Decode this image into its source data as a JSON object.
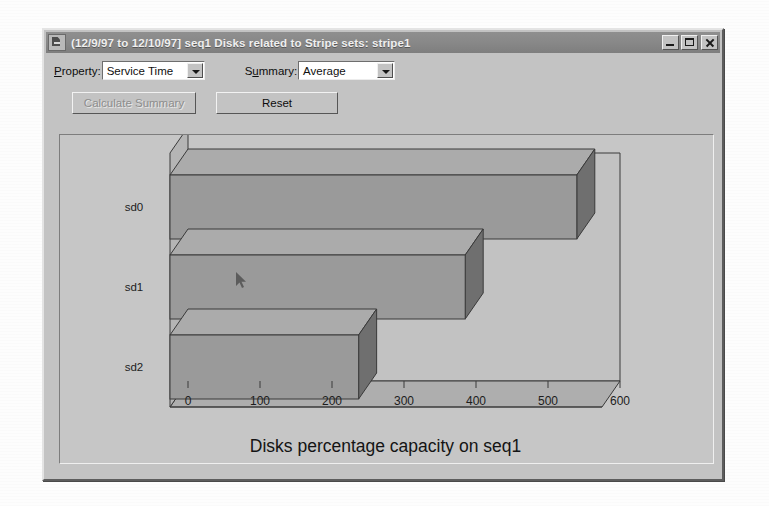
{
  "window": {
    "title": "(12/9/97 to 12/10/97] seq1 Disks related to Stripe sets: stripe1",
    "system_icon": "application-icon",
    "controls": {
      "minimize": "minimize-icon",
      "maximize": "maximize-icon",
      "close": "close-icon"
    }
  },
  "toolbar": {
    "property": {
      "label": "Property:",
      "label_prefix": "P",
      "label_rest": "roperty:",
      "value": "Service Time",
      "options": [
        "Service Time"
      ]
    },
    "summary": {
      "label": "Summary:",
      "label_prefix": "S",
      "label_mid": "u",
      "label_rest": "mmary:",
      "value": "Average",
      "options": [
        "Average"
      ]
    },
    "calculate_summary_label": "Calculate Summary",
    "calculate_summary_enabled": false,
    "reset_label": "Reset",
    "reset_enabled": true
  },
  "chart_data": {
    "type": "bar",
    "orientation": "horizontal",
    "style": "3d",
    "title": "Disks percentage capacity on seq1",
    "xlabel": "",
    "ylabel": "",
    "categories": [
      "sd0",
      "sd1",
      "sd2"
    ],
    "values": [
      565,
      410,
      262
    ],
    "series": [
      {
        "name": "Service Time",
        "values": [
          565,
          410,
          262
        ]
      }
    ],
    "xlim": [
      0,
      600
    ],
    "xticks": [
      0,
      100,
      200,
      300,
      400,
      500,
      600
    ],
    "xtick_labels": [
      "0",
      "100",
      "200",
      "300",
      "400",
      "500",
      "600"
    ],
    "grid": false,
    "legend": "none",
    "bar_color": "#9a9a9a",
    "bar_top_color": "#ababab",
    "bar_side_color": "#6f6f6f",
    "floor_color": "#aeaeae",
    "wall_color": "#c2c2c2"
  },
  "colors": {
    "window_face": "#c3c3c3",
    "titlebar": "#888888",
    "titlebar_text": "#efefef",
    "text": "#0d0d0d",
    "disabled_text": "#8d8d8d",
    "chart_bar": "#9a9a9a"
  }
}
